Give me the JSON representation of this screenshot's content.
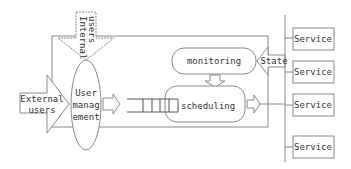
{
  "diagram": {
    "internal_users": {
      "line1": "Internal",
      "line2": "users"
    },
    "external_users": {
      "line1": "External",
      "line2": "users"
    },
    "user_management": {
      "line1": "User",
      "line2": "manag",
      "line3": "ement"
    },
    "monitoring": "monitoring",
    "scheduling": "scheduling",
    "state": "State",
    "services": [
      "Service",
      "Service",
      "Service",
      "Service"
    ]
  },
  "colors": {
    "stroke": "#888888",
    "text": "#333333",
    "background": "#ffffff"
  }
}
